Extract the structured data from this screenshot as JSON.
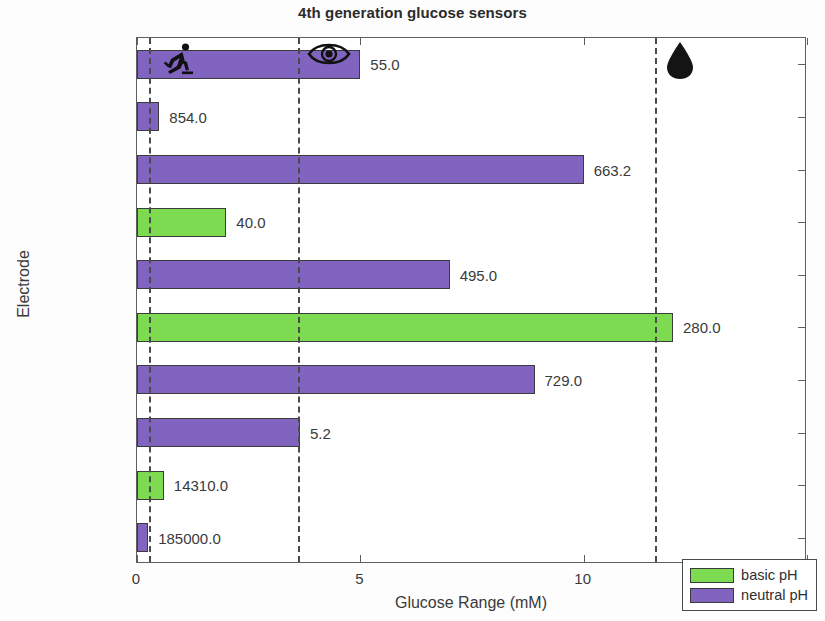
{
  "chart_data": {
    "type": "bar",
    "orientation": "horizontal",
    "title": "4th generation glucose sensors",
    "xlabel": "Glucose Range (mM)",
    "ylabel": "Electrode",
    "xlim": [
      0,
      15
    ],
    "xticks": [
      "0",
      "5",
      "10",
      "15"
    ],
    "xtick_values": [
      0,
      5,
      10,
      15
    ],
    "grid": false,
    "legend_position": "lower right",
    "categories": [
      "Co MOF [10]",
      "CoOx [9]",
      "CuOx [2]",
      "Cu MOF [3]",
      "Cu NPS [1]",
      "Pt + CuS [11]",
      "NiOx [7]",
      "Ni - C [5]",
      "Ni - MOF [6]",
      "Ni NPs [4]"
    ],
    "bars": [
      {
        "category": "Co MOF [10]",
        "value": 5.0,
        "label": "55.0",
        "series": "neutral pH"
      },
      {
        "category": "CoOx [9]",
        "value": 0.5,
        "label": "854.0",
        "series": "neutral pH"
      },
      {
        "category": "CuOx [2]",
        "value": 10.0,
        "label": "663.2",
        "series": "neutral pH"
      },
      {
        "category": "Cu MOF [3]",
        "value": 2.0,
        "label": "40.0",
        "series": "basic pH"
      },
      {
        "category": "Cu NPS [1]",
        "value": 7.0,
        "label": "495.0",
        "series": "neutral pH"
      },
      {
        "category": "Pt + CuS [11]",
        "value": 12.0,
        "label": "280.0",
        "series": "basic pH"
      },
      {
        "category": "NiOx [7]",
        "value": 8.9,
        "label": "729.0",
        "series": "neutral pH"
      },
      {
        "category": "Ni - C [5]",
        "value": 3.65,
        "label": "5.2",
        "series": "neutral pH"
      },
      {
        "category": "Ni - MOF [6]",
        "value": 0.6,
        "label": "14310.0",
        "series": "basic pH"
      },
      {
        "category": "Ni NPs [4]",
        "value": 0.25,
        "label": "185000.0",
        "series": "neutral pH"
      }
    ],
    "series": [
      {
        "name": "basic pH",
        "color": "#7ddb52"
      },
      {
        "name": "neutral pH",
        "color": "#8164c0"
      }
    ],
    "reference_lines": [
      {
        "value": 0.27,
        "icon": "running-person-icon"
      },
      {
        "value": 3.6,
        "icon": "eye-icon"
      },
      {
        "value": 11.6,
        "icon": "blood-drop-icon"
      }
    ]
  },
  "legend": {
    "items": [
      {
        "label": "basic pH",
        "key": "basic"
      },
      {
        "label": "neutral pH",
        "key": "neutral"
      }
    ]
  }
}
